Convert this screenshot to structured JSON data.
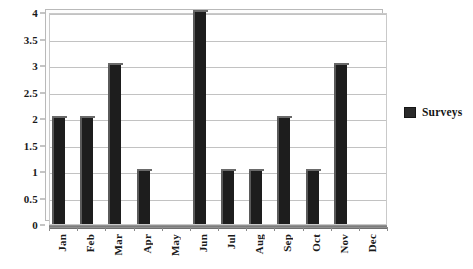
{
  "chart_data": {
    "type": "bar",
    "title": "",
    "xlabel": "",
    "ylabel": "",
    "categories": [
      "Jan",
      "Feb",
      "Mar",
      "Apr",
      "May",
      "Jun",
      "Jul",
      "Aug",
      "Sep",
      "Oct",
      "Nov",
      "Dec"
    ],
    "series": [
      {
        "name": "Surveys",
        "values": [
          2,
          2,
          3,
          1,
          0,
          4,
          1,
          1,
          2,
          1,
          3,
          0
        ],
        "color": "#1d1d1d"
      }
    ],
    "ylim": [
      0,
      4
    ],
    "y_ticks": [
      "0",
      "0.5",
      "1",
      "1.5",
      "2",
      "2.5",
      "3",
      "3.5",
      "4"
    ],
    "y_tick_values": [
      0,
      0.5,
      1,
      1.5,
      2,
      2.5,
      3,
      3.5,
      4
    ],
    "grid": true,
    "grid_orientation": "horizontal",
    "legend_position": "right",
    "legend_entries": [
      "Surveys"
    ],
    "x_tick_rotation": 90,
    "style": "3d-column"
  },
  "legend": {
    "items": [
      {
        "label": "Surveys",
        "swatch_color": "#2a2a2a"
      }
    ]
  },
  "colors": {
    "bar": "#1d1d1d",
    "bar_highlight": "#5a5a5a",
    "gridline": "#c2c2c2",
    "axis": "#8a8a8a",
    "plot_background": "#ffffff",
    "page_background": "#ffffff",
    "text": "#1a1a1a"
  }
}
